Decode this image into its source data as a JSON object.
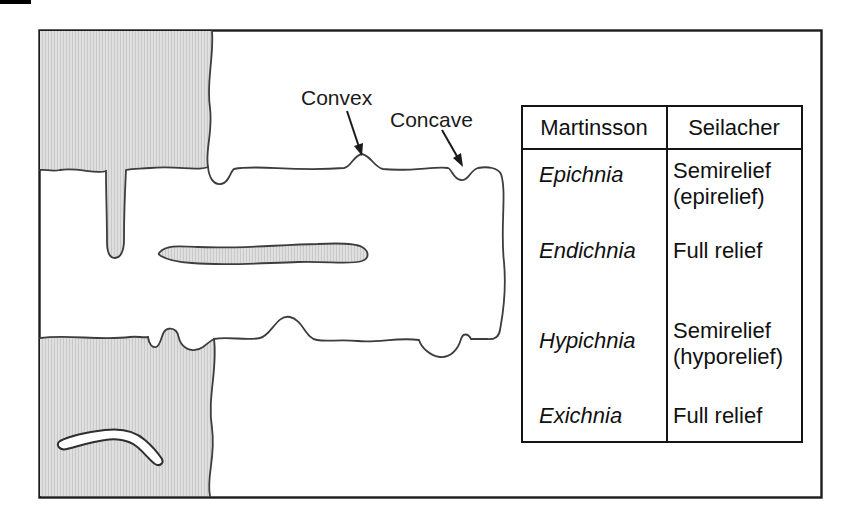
{
  "figure_labels": {
    "convex": "Convex",
    "concave": "Concave"
  },
  "table": {
    "headers": [
      "Martinsson",
      "Seilacher"
    ],
    "rows": [
      {
        "martinsson": "Epichnia",
        "seilacher_line1": "Semirelief",
        "seilacher_line2": "(epirelief)"
      },
      {
        "martinsson": "Endichnia",
        "seilacher_line1": "Full relief",
        "seilacher_line2": ""
      },
      {
        "martinsson": "Hypichnia",
        "seilacher_line1": "Semirelief",
        "seilacher_line2": "(hyporelief)"
      },
      {
        "martinsson": "Exichnia",
        "seilacher_line1": "Full relief",
        "seilacher_line2": ""
      }
    ]
  },
  "colors": {
    "bed_fill": "#dcdcdc",
    "bed_stripe": "#c9c9c9",
    "outline": "#3d3d3d",
    "frame": "#1c1c1c",
    "text": "#111111",
    "background": "#ffffff"
  }
}
